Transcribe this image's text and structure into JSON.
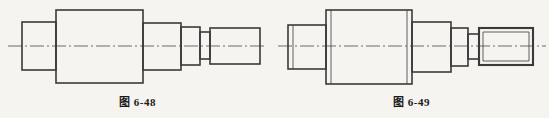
{
  "page": {
    "background_color": "#f6f4f0",
    "line_color": "#3a3a3a",
    "centerline_color": "#6a6a6a"
  },
  "figures": [
    {
      "id": "fig-6-48",
      "caption_label": "图",
      "caption_number": "6-48",
      "caption_full": "图 6-48",
      "description": "stepped shaft front view, plain right end",
      "geometry": {
        "centerline_y": 46,
        "centerline_x1": 8,
        "centerline_x2": 265,
        "steps": [
          {
            "name": "step-1-left-cylinder",
            "x": 22,
            "y": 22,
            "w": 34,
            "h": 48,
            "threaded": false,
            "chamfer": false
          },
          {
            "name": "step-2-main-block",
            "x": 56,
            "y": 10,
            "w": 87,
            "h": 73,
            "threaded": false,
            "chamfer": false
          },
          {
            "name": "step-3-medium",
            "x": 143,
            "y": 23,
            "w": 38,
            "h": 47,
            "threaded": false,
            "chamfer": false
          },
          {
            "name": "step-4-small",
            "x": 181,
            "y": 27,
            "w": 19,
            "h": 38,
            "threaded": false,
            "chamfer": false
          },
          {
            "name": "step-5-collar",
            "x": 200,
            "y": 32,
            "w": 10,
            "h": 27,
            "threaded": false,
            "chamfer": false
          },
          {
            "name": "step-6-right-end",
            "x": 210,
            "y": 28,
            "w": 50,
            "h": 36,
            "threaded": false,
            "chamfer": false
          }
        ]
      }
    },
    {
      "id": "fig-6-49",
      "caption_label": "图",
      "caption_number": "6-49",
      "caption_full": "图 6-49",
      "description": "stepped shaft front view with chamfers and threaded right end",
      "geometry": {
        "centerline_y": 46,
        "centerline_x1": 8,
        "centerline_x2": 272,
        "steps": [
          {
            "name": "step-1-left-cylinder",
            "x": 14,
            "y": 25,
            "w": 38,
            "h": 44,
            "threaded": false,
            "chamfer": true
          },
          {
            "name": "step-2-main-block",
            "x": 52,
            "y": 10,
            "w": 86,
            "h": 74,
            "threaded": false,
            "chamfer": true
          },
          {
            "name": "step-3-medium",
            "x": 138,
            "y": 22,
            "w": 39,
            "h": 50,
            "threaded": false,
            "chamfer": true
          },
          {
            "name": "step-4-small",
            "x": 177,
            "y": 28,
            "w": 17,
            "h": 38,
            "threaded": false,
            "chamfer": false
          },
          {
            "name": "step-5-collar",
            "x": 194,
            "y": 34,
            "w": 11,
            "h": 25,
            "threaded": false,
            "chamfer": false
          },
          {
            "name": "step-6-threaded-end",
            "x": 205,
            "y": 28,
            "w": 54,
            "h": 37,
            "threaded": true,
            "chamfer": true
          }
        ]
      }
    }
  ]
}
